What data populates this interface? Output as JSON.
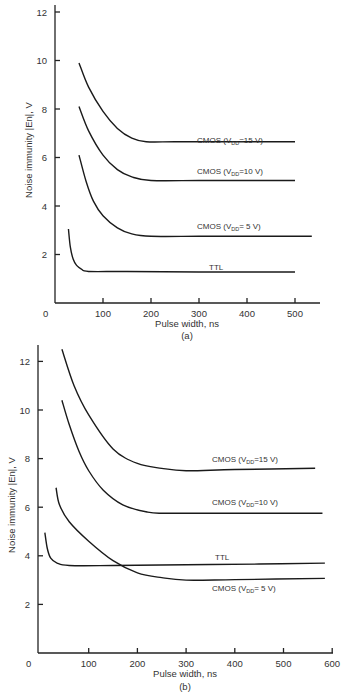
{
  "chart_data": [
    {
      "id": "a",
      "type": "line",
      "caption": "(a)",
      "xlabel": "Pulse width, ns",
      "ylabel": "Noise immunity |En|, V",
      "xlim": [
        0,
        550
      ],
      "ylim": [
        0,
        12
      ],
      "xticks": [
        0,
        100,
        200,
        300,
        400,
        500
      ],
      "yticks": [
        2,
        4,
        6,
        8,
        10,
        12
      ],
      "grid": false,
      "series": [
        {
          "name": "CMOS (VDD=15 V)",
          "label_main": "CMOS (V",
          "label_sub": "DD",
          "label_tail": "=15 V)",
          "x": [
            50,
            70,
            100,
            130,
            160,
            190,
            250,
            350,
            500
          ],
          "y": [
            9.9,
            8.9,
            7.9,
            7.2,
            6.8,
            6.65,
            6.65,
            6.65,
            6.65
          ]
        },
        {
          "name": "CMOS (VDD=10 V)",
          "label_main": "CMOS (V",
          "label_sub": "DD",
          "label_tail": "=10 V)",
          "x": [
            50,
            70,
            100,
            130,
            160,
            200,
            300,
            400,
            500
          ],
          "y": [
            8.1,
            7.1,
            6.1,
            5.5,
            5.2,
            5.05,
            5.05,
            5.05,
            5.05
          ]
        },
        {
          "name": "CMOS (VDD=5 V)",
          "label_main": "CMOS (V",
          "label_sub": "DD",
          "label_tail": "= 5 V)",
          "x": [
            50,
            65,
            80,
            100,
            130,
            160,
            200,
            300,
            400,
            535
          ],
          "y": [
            6.1,
            5.0,
            4.2,
            3.6,
            3.1,
            2.85,
            2.75,
            2.75,
            2.75,
            2.75
          ]
        },
        {
          "name": "TTL",
          "label_main": "TTL",
          "label_sub": "",
          "label_tail": "",
          "x": [
            28,
            32,
            38,
            45,
            55,
            70,
            150,
            300,
            500
          ],
          "y": [
            3.05,
            2.3,
            1.8,
            1.55,
            1.4,
            1.3,
            1.3,
            1.28,
            1.28
          ]
        }
      ]
    },
    {
      "id": "b",
      "type": "line",
      "caption": "(b)",
      "xlabel": "Pulse width, ns",
      "ylabel": "Noise immunity |En|, V",
      "xlim": [
        0,
        600
      ],
      "ylim": [
        0,
        12.5
      ],
      "xticks": [
        0,
        100,
        200,
        300,
        400,
        500,
        600
      ],
      "yticks": [
        2,
        4,
        6,
        8,
        10,
        12
      ],
      "grid": false,
      "series": [
        {
          "name": "CMOS (VDD=15 V)",
          "label_main": "CMOS (V",
          "label_sub": "DD",
          "label_tail": "=15 V)",
          "x": [
            45,
            70,
            100,
            150,
            200,
            250,
            300,
            400,
            565
          ],
          "y": [
            12.5,
            11.0,
            9.8,
            8.4,
            7.8,
            7.6,
            7.5,
            7.55,
            7.6
          ]
        },
        {
          "name": "CMOS (VDD=10 V)",
          "label_main": "CMOS (V",
          "label_sub": "DD",
          "label_tail": "=10 V)",
          "x": [
            45,
            60,
            80,
            100,
            130,
            170,
            220,
            260,
            400,
            580
          ],
          "y": [
            10.4,
            9.4,
            8.3,
            7.5,
            6.7,
            6.1,
            5.8,
            5.75,
            5.75,
            5.75
          ]
        },
        {
          "name": "CMOS (VDD=5 V)",
          "label_main": "CMOS (V",
          "label_sub": "DD",
          "label_tail": "= 5 V)",
          "x": [
            33,
            40,
            60,
            100,
            150,
            200,
            250,
            300,
            400,
            585
          ],
          "y": [
            6.8,
            6.1,
            5.4,
            4.6,
            3.8,
            3.3,
            3.1,
            3.0,
            3.02,
            3.07
          ]
        },
        {
          "name": "TTL",
          "label_main": "TTL",
          "label_sub": "",
          "label_tail": "",
          "x": [
            10,
            15,
            22,
            35,
            60,
            150,
            300,
            450,
            585
          ],
          "y": [
            4.95,
            4.3,
            3.9,
            3.7,
            3.6,
            3.6,
            3.63,
            3.66,
            3.7
          ]
        }
      ]
    }
  ],
  "labels": {
    "a": {
      "caption": "(a)",
      "xlabel": "Pulse width, ns",
      "ylabel": "Noise immunity |En|, V",
      "origin": "0",
      "xticks": [
        "100",
        "200",
        "300",
        "400",
        "500"
      ],
      "yticks": [
        "2",
        "4",
        "6",
        "8",
        "10",
        "12"
      ]
    },
    "b": {
      "caption": "(b)",
      "xlabel": "Pulse width, ns",
      "ylabel": "Noise immunity |En|, V",
      "origin": "0",
      "xticks": [
        "100",
        "200",
        "300",
        "400",
        "500",
        "600"
      ],
      "yticks": [
        "2",
        "4",
        "6",
        "8",
        "10",
        "12"
      ]
    }
  }
}
